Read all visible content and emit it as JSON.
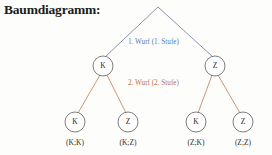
{
  "title": "Baumdiagramm:",
  "diagram": {
    "type": "tree",
    "root": {
      "label": "",
      "x": 158,
      "y": 7
    },
    "stage_labels": [
      {
        "id": "stage-1",
        "text": "1. Wurf (1. Stufe)",
        "color": "#5f7aa8"
      },
      {
        "id": "stage-2",
        "text": "2. Wurf (2. Stufe)",
        "color": "#c2703f"
      }
    ],
    "level1": [
      {
        "label": "K",
        "x": 103,
        "y": 66
      },
      {
        "label": "Z",
        "x": 215,
        "y": 66
      }
    ],
    "level2": [
      {
        "label": "K",
        "outcome": "(K;K)",
        "x": 75,
        "y": 122,
        "parent": "K"
      },
      {
        "label": "Z",
        "outcome": "(K;Z)",
        "x": 128,
        "y": 122,
        "parent": "K"
      },
      {
        "label": "K",
        "outcome": "(Z;K)",
        "x": 196,
        "y": 122,
        "parent": "Z"
      },
      {
        "label": "Z",
        "outcome": "(Z;Z)",
        "x": 243,
        "y": 122,
        "parent": "Z"
      }
    ],
    "colors": {
      "branch_level1": "#7b8aa6",
      "branch_level2": "#c98a63",
      "node_stroke": "#5d5d5d",
      "node_fill": "#ffffff",
      "text": "#2a2a2a",
      "background": "#fdfdfc"
    }
  }
}
